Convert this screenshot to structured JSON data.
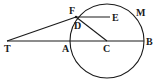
{
  "diagram": {
    "type": "geometry",
    "stroke_color": "#1a1a1a",
    "background": "#ffffff",
    "circle": {
      "center": "C",
      "cx": 107,
      "cy": 41,
      "r": 37
    },
    "points": {
      "T": {
        "x": 7,
        "y": 41,
        "label": "T"
      },
      "A": {
        "x": 71,
        "y": 41,
        "label": "A"
      },
      "C": {
        "x": 107,
        "y": 41,
        "label": "C"
      },
      "B": {
        "x": 144,
        "y": 41,
        "label": "B"
      },
      "F": {
        "x": 76,
        "y": 16,
        "label": "F"
      },
      "D": {
        "x": 77,
        "y": 20,
        "label": "D"
      },
      "E": {
        "x": 112,
        "y": 17,
        "label": "E"
      },
      "M": {
        "label": "M"
      }
    },
    "segments": [
      "T-B",
      "T-F",
      "F-E",
      "F-C"
    ],
    "labels": [
      "F",
      "E",
      "M",
      "D",
      "T",
      "A",
      "C",
      "B"
    ]
  }
}
